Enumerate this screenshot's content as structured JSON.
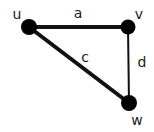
{
  "diagram": {
    "type": "graph",
    "nodes": [
      {
        "id": "u",
        "label": "u",
        "x": 29,
        "y": 27,
        "r": 8,
        "label_x": 17,
        "label_y": 19
      },
      {
        "id": "v",
        "label": "v",
        "x": 128,
        "y": 27,
        "r": 7.5,
        "label_x": 139,
        "label_y": 19
      },
      {
        "id": "w",
        "label": "w",
        "x": 129,
        "y": 103,
        "r": 8,
        "label_x": 137,
        "label_y": 125
      }
    ],
    "edges": [
      {
        "id": "a",
        "label": "a",
        "from": "u",
        "to": "v",
        "width": 4,
        "label_x": 78,
        "label_y": 18
      },
      {
        "id": "c",
        "label": "c",
        "from": "u",
        "to": "w",
        "width": 4,
        "label_x": 85,
        "label_y": 62
      },
      {
        "id": "d",
        "label": "d",
        "from": "v",
        "to": "w",
        "width": 2,
        "label_x": 142,
        "label_y": 67
      }
    ],
    "colors": {
      "node": "#000000",
      "edge": "#111111",
      "label": "#1a1a1a",
      "background": "#ffffff"
    }
  }
}
